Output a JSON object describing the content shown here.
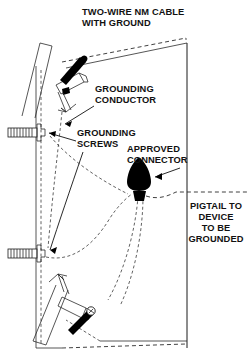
{
  "diagram": {
    "title_lines": [
      "TWO-WIRE NM CABLE",
      "WITH GROUND"
    ],
    "labels": {
      "grounding_conductor": [
        "GROUNDING",
        "CONDUCTOR"
      ],
      "grounding_screws": [
        "GROUNDING",
        "SCREWS"
      ],
      "approved_connector": [
        "APPROVED",
        "CONNECTOR"
      ],
      "pigtail": [
        "PIGTAIL TO",
        "DEVICE",
        "TO BE",
        "GROUNDED"
      ]
    },
    "colors": {
      "ink": "#111111",
      "line": "#1a1a1a",
      "hidden_line": "#2b2b2b",
      "background": "#ffffff",
      "solid_part": "#000000"
    }
  }
}
